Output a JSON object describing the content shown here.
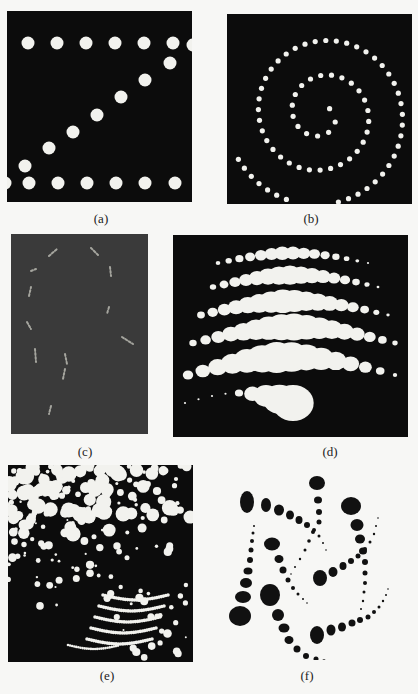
{
  "figure": {
    "panels": [
      {
        "id": "a",
        "label": "(a)",
        "description": "Two horizontal rows of evenly spaced white dots joined by a diagonal line of dots on black background"
      },
      {
        "id": "b",
        "label": "(b)",
        "description": "Spiral arrangement of small white dots on black background"
      },
      {
        "id": "c",
        "label": "(c)",
        "description": "Faint light dot strokes tracing a curved outline on dark gray background"
      },
      {
        "id": "d",
        "label": "(d)",
        "description": "Wavy rows of white ellipses of varying size on black background"
      },
      {
        "id": "e",
        "label": "(e)",
        "description": "Dense cloud of white dots of varying size forming a swirling texture on black background"
      },
      {
        "id": "f",
        "label": "(f)",
        "description": "Black dots of decreasing size arranged in pinwheel curves on white background"
      }
    ],
    "colors": {
      "page": "#f7f7f5",
      "dark_panel": "#0c0c0c",
      "gray_panel": "#3a3a3a",
      "light_dot": "#f2f2ee",
      "dark_dot": "#111111"
    }
  }
}
